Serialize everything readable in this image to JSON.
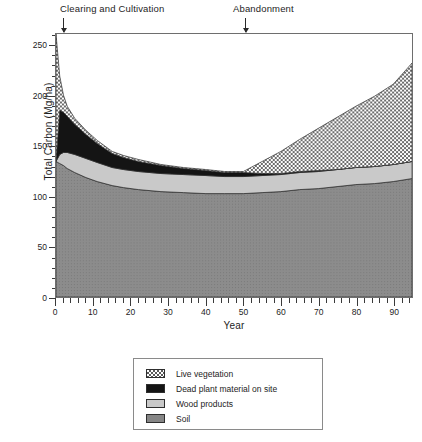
{
  "chart_data": {
    "type": "area",
    "stacked": true,
    "title": "",
    "xlabel": "Year",
    "ylabel": "Total Carbon (Mg/ha)",
    "xlim": [
      0,
      95
    ],
    "ylim": [
      0,
      262
    ],
    "xticks": [
      0,
      10,
      20,
      30,
      40,
      50,
      60,
      70,
      80,
      90
    ],
    "yticks": [
      0,
      50,
      100,
      150,
      200,
      250
    ],
    "xtick_labels": [
      "0",
      "10",
      "20",
      "30",
      "40",
      "50",
      "60",
      "70",
      "80",
      "90"
    ],
    "ytick_labels": [
      "0",
      "50",
      "100",
      "150",
      "200",
      "250"
    ],
    "x_minor_tick_interval": 2,
    "y_minor_tick_interval": 10,
    "grid": false,
    "legend_position": "below-plot",
    "x": [
      0,
      1,
      2,
      3,
      5,
      8,
      11,
      15,
      18,
      22,
      28,
      34,
      40,
      45,
      50,
      55,
      60,
      65,
      70,
      75,
      80,
      85,
      90,
      95
    ],
    "series": [
      {
        "name": "Soil",
        "order": 1,
        "fill": "#868686",
        "pattern": "solid-medium-gray",
        "values": [
          135,
          133,
          131,
          128,
          124,
          119,
          115,
          111,
          109,
          107,
          105,
          104,
          103,
          103,
          103,
          104,
          105,
          107,
          108,
          110,
          112,
          113,
          115,
          118
        ]
      },
      {
        "name": "Wood products",
        "order": 2,
        "fill": "#c9c9c9",
        "pattern": "solid-light-gray",
        "values": [
          0,
          9,
          13,
          16,
          18,
          19,
          19,
          18,
          18,
          18,
          18,
          18,
          18,
          17,
          17,
          17,
          17,
          17,
          17,
          17,
          17,
          17,
          17,
          17
        ]
      },
      {
        "name": "Dead plant material on site",
        "order": 3,
        "fill": "#141414",
        "pattern": "solid-black",
        "values": [
          0,
          44,
          40,
          36,
          30,
          24,
          19,
          14,
          12,
          10,
          8,
          6,
          5,
          4,
          4,
          2,
          1,
          1,
          1,
          0,
          0,
          0,
          0,
          0
        ]
      },
      {
        "name": "Live vegetation",
        "order": 4,
        "fill": "#9a9a9a",
        "pattern": "checkerboard-stipple",
        "values": [
          127,
          34,
          17,
          10,
          6,
          4,
          3,
          2,
          2,
          2,
          1,
          1,
          1,
          1,
          1,
          12,
          22,
          32,
          42,
          52,
          61,
          70,
          80,
          98
        ]
      }
    ],
    "totals": [
      262,
      220,
      201,
      190,
      178,
      166,
      156,
      145,
      141,
      137,
      132,
      129,
      127,
      125,
      125,
      135,
      145,
      157,
      168,
      179,
      190,
      200,
      212,
      233
    ],
    "annotations": [
      {
        "text": "Clearing and Cultivation",
        "points_to_year": 1,
        "label_x": 60,
        "label_y": 3
      },
      {
        "text": "Abandonment",
        "points_to_year": 50,
        "label_x": 233,
        "label_y": 3
      }
    ]
  },
  "legend": {
    "items": [
      {
        "label": "Live vegetation",
        "swatch": "sw-live"
      },
      {
        "label": "Dead plant material on site",
        "swatch": "sw-dead"
      },
      {
        "label": "Wood products",
        "swatch": "sw-wood"
      },
      {
        "label": "Soil",
        "swatch": "sw-soil"
      }
    ]
  },
  "colors": {
    "live_vegetation": "#9a9a9a",
    "dead_plant_material": "#141414",
    "wood_products": "#c9c9c9",
    "soil": "#868686",
    "axis": "#3a3a3a",
    "frame": "#6e6e6e"
  }
}
